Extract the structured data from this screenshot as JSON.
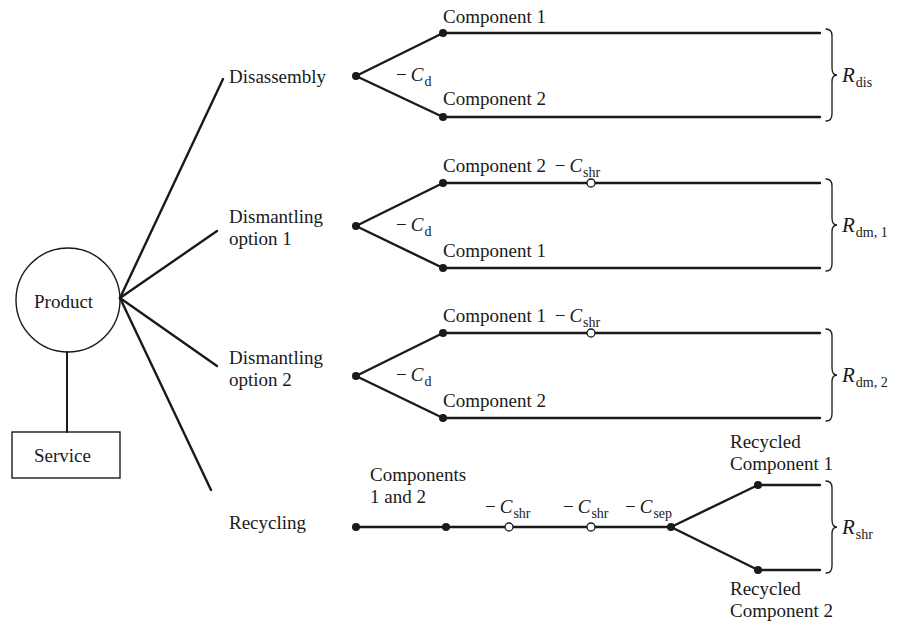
{
  "root": {
    "product": "Product",
    "service": "Service"
  },
  "branches": [
    {
      "label_lines": [
        "Disassembly"
      ],
      "cost": {
        "sign": "−",
        "symbol": "C",
        "sub": "d"
      },
      "top": {
        "label": "Component 1"
      },
      "bottom": {
        "label": "Component 2"
      },
      "revenue": {
        "symbol": "R",
        "sub": "dis"
      }
    },
    {
      "label_lines": [
        "Dismantling",
        "option 1"
      ],
      "cost": {
        "sign": "−",
        "symbol": "C",
        "sub": "d"
      },
      "top": {
        "label": "Component 2",
        "cost": {
          "sign": "−",
          "symbol": "C",
          "sub": "shr"
        }
      },
      "bottom": {
        "label": "Component 1"
      },
      "revenue": {
        "symbol": "R",
        "sub": "dm, 1"
      }
    },
    {
      "label_lines": [
        "Dismantling",
        "option 2"
      ],
      "cost": {
        "sign": "−",
        "symbol": "C",
        "sub": "d"
      },
      "top": {
        "label": "Component 1",
        "cost": {
          "sign": "−",
          "symbol": "C",
          "sub": "shr"
        }
      },
      "bottom": {
        "label": "Component 2"
      },
      "revenue": {
        "symbol": "R",
        "sub": "dm, 2"
      }
    },
    {
      "label_lines": [
        "Recycling"
      ],
      "input_lines": [
        "Components",
        "1 and 2"
      ],
      "costs": [
        {
          "sign": "−",
          "symbol": "C",
          "sub": "shr"
        },
        {
          "sign": "−",
          "symbol": "C",
          "sub": "shr"
        },
        {
          "sign": "−",
          "symbol": "C",
          "sub": "sep"
        }
      ],
      "top": {
        "label_lines": [
          "Recycled",
          "Component 1"
        ]
      },
      "bottom": {
        "label_lines": [
          "Recycled",
          "Component 2"
        ]
      },
      "revenue": {
        "symbol": "R",
        "sub": "shr"
      }
    }
  ],
  "colors": {
    "line": "#1a1a1a",
    "background": "#ffffff"
  }
}
